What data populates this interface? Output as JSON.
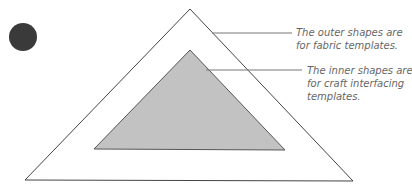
{
  "diagram": {
    "colors": {
      "background": "#ffffff",
      "outer_stroke": "#444444",
      "inner_fill": "#c2c2c2",
      "inner_stroke": "#555555",
      "dot": "#3a3a3a",
      "leader": "#777777",
      "text": "#666666"
    },
    "shapes": {
      "dot": {
        "cx": 23,
        "cy": 37,
        "r": 14
      },
      "outer_triangle": {
        "points": [
          [
            190,
            9
          ],
          [
            25,
            180
          ],
          [
            353,
            181
          ]
        ]
      },
      "inner_triangle": {
        "points": [
          [
            190,
            50
          ],
          [
            94,
            149
          ],
          [
            285,
            150
          ]
        ]
      }
    },
    "annotations": [
      {
        "lines": [
          "The outer shapes are",
          "for fabric templates."
        ],
        "leader": {
          "x1": 212,
          "y1": 33,
          "x2": 292,
          "y2": 33
        }
      },
      {
        "lines": [
          "The inner shapes are",
          "for craft interfacing",
          "templates."
        ],
        "leader": {
          "x1": 206,
          "y1": 70,
          "x2": 302,
          "y2": 70
        }
      }
    ]
  }
}
